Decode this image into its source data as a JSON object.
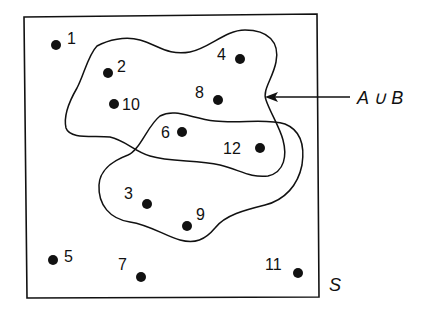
{
  "diagram": {
    "type": "venn",
    "universe_label": "S",
    "union_label": "A ∪ B",
    "points": [
      {
        "id": "1",
        "label": "1",
        "cx": 56,
        "cy": 45,
        "lx": 67,
        "ly": 44
      },
      {
        "id": "2",
        "label": "2",
        "cx": 108,
        "cy": 73,
        "lx": 117,
        "ly": 72
      },
      {
        "id": "4",
        "label": "4",
        "cx": 240,
        "cy": 59,
        "lx": 217,
        "ly": 60
      },
      {
        "id": "8",
        "label": "8",
        "cx": 218,
        "cy": 100,
        "lx": 195,
        "ly": 98
      },
      {
        "id": "10",
        "label": "10",
        "cx": 114,
        "cy": 104,
        "lx": 122,
        "ly": 110
      },
      {
        "id": "6",
        "label": "6",
        "cx": 182,
        "cy": 132,
        "lx": 161,
        "ly": 138
      },
      {
        "id": "12",
        "label": "12",
        "cx": 260,
        "cy": 148,
        "lx": 223,
        "ly": 154
      },
      {
        "id": "3",
        "label": "3",
        "cx": 147,
        "cy": 204,
        "lx": 124,
        "ly": 199
      },
      {
        "id": "9",
        "label": "9",
        "cx": 187,
        "cy": 226,
        "lx": 196,
        "ly": 220
      },
      {
        "id": "5",
        "label": "5",
        "cx": 53,
        "cy": 260,
        "lx": 64,
        "ly": 262
      },
      {
        "id": "7",
        "label": "7",
        "cx": 141,
        "cy": 277,
        "lx": 118,
        "ly": 270
      },
      {
        "id": "11",
        "label": "11",
        "cx": 298,
        "cy": 273,
        "lx": 265,
        "ly": 270
      }
    ],
    "sets": {
      "A": [
        "2",
        "4",
        "8",
        "10",
        "6",
        "12"
      ],
      "B": [
        "6",
        "12",
        "3",
        "9"
      ],
      "outside": [
        "1",
        "5",
        "7",
        "11"
      ]
    },
    "colors": {
      "stroke": "#111111",
      "background": "#ffffff"
    }
  }
}
